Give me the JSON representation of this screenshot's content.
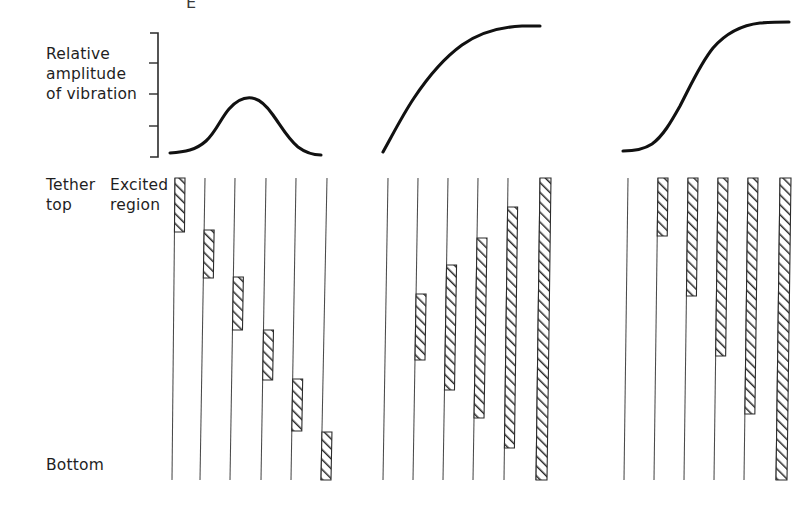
{
  "figure": {
    "clipped_top_text": "E",
    "axis_label_lines": [
      "Relative",
      "amplitude",
      "of vibration"
    ],
    "tether_top_label_lines": [
      "Tether",
      "top"
    ],
    "excited_region_label_lines": [
      "Excited",
      "region"
    ],
    "bottom_label": "Bottom",
    "ink_color": "#111111",
    "line_color": "#4a4a4a",
    "hatch_color": "#2b2b2b",
    "background_color": "#ffffff"
  },
  "chart_data": {
    "type": "line",
    "title": "",
    "subtitle": "",
    "xlabel": "",
    "ylabel": "Relative amplitude of vibration",
    "grid": false,
    "legend_position": "none",
    "axis_notes": "Vertical bracket scale at left of curve row with 3 intermediate tick marks; no numeric tick labels shown.",
    "scale_bracket": {
      "x": 157,
      "y_top": 32,
      "y_bottom": 158,
      "tick_count": 3,
      "tick_y": [
        63,
        94,
        126
      ],
      "tick_length": 9
    },
    "panels": [
      {
        "name": "panel-1-first-mode",
        "curve_shape": "single-hump",
        "x_range": [
          170,
          320
        ],
        "y_range_px": [
          98,
          155
        ],
        "points": [
          {
            "x": 0.0,
            "y": 0.04
          },
          {
            "x": 0.1,
            "y": 0.06
          },
          {
            "x": 0.2,
            "y": 0.16
          },
          {
            "x": 0.3,
            "y": 0.38
          },
          {
            "x": 0.42,
            "y": 0.72
          },
          {
            "x": 0.52,
            "y": 0.94
          },
          {
            "x": 0.58,
            "y": 1.0
          },
          {
            "x": 0.66,
            "y": 0.95
          },
          {
            "x": 0.76,
            "y": 0.72
          },
          {
            "x": 0.86,
            "y": 0.38
          },
          {
            "x": 0.94,
            "y": 0.14
          },
          {
            "x": 1.0,
            "y": 0.06
          }
        ]
      },
      {
        "name": "panel-2-rising-saturating",
        "curve_shape": "concave-rising-plateau",
        "x_range": [
          382,
          540
        ],
        "y_range_px": [
          26,
          152
        ],
        "points": [
          {
            "x": 0.0,
            "y": 0.0
          },
          {
            "x": 0.08,
            "y": 0.18
          },
          {
            "x": 0.18,
            "y": 0.4
          },
          {
            "x": 0.3,
            "y": 0.62
          },
          {
            "x": 0.44,
            "y": 0.8
          },
          {
            "x": 0.58,
            "y": 0.91
          },
          {
            "x": 0.72,
            "y": 0.97
          },
          {
            "x": 0.86,
            "y": 0.99
          },
          {
            "x": 1.0,
            "y": 1.0
          }
        ]
      },
      {
        "name": "panel-3-sigmoid",
        "curve_shape": "sigmoid",
        "x_range": [
          622,
          788
        ],
        "y_range_px": [
          22,
          152
        ],
        "points": [
          {
            "x": 0.0,
            "y": 0.02
          },
          {
            "x": 0.1,
            "y": 0.03
          },
          {
            "x": 0.2,
            "y": 0.08
          },
          {
            "x": 0.32,
            "y": 0.22
          },
          {
            "x": 0.44,
            "y": 0.44
          },
          {
            "x": 0.56,
            "y": 0.68
          },
          {
            "x": 0.68,
            "y": 0.86
          },
          {
            "x": 0.8,
            "y": 0.96
          },
          {
            "x": 0.9,
            "y": 0.99
          },
          {
            "x": 1.0,
            "y": 1.0
          }
        ]
      }
    ]
  },
  "tether_groups": [
    {
      "name": "group-1",
      "description": "Excited region is a short block migrating progressively downward from tether top to bottom.",
      "tether_top_y": 178,
      "tether_bottom_y": 480,
      "tethers": [
        {
          "x_top": 175,
          "x_bottom": 172,
          "bar_top": 178,
          "bar_bottom": 232,
          "bar_width": 10
        },
        {
          "x_top": 205,
          "x_bottom": 200,
          "bar_top": 230,
          "bar_bottom": 278,
          "bar_width": 10
        },
        {
          "x_top": 235,
          "x_bottom": 230,
          "bar_top": 277,
          "bar_bottom": 330,
          "bar_width": 10
        },
        {
          "x_top": 266,
          "x_bottom": 261,
          "bar_top": 330,
          "bar_bottom": 380,
          "bar_width": 10
        },
        {
          "x_top": 296,
          "x_bottom": 291,
          "bar_top": 379,
          "bar_bottom": 431,
          "bar_width": 10
        },
        {
          "x_top": 327,
          "x_bottom": 321,
          "bar_top": 432,
          "bar_bottom": 480,
          "bar_width": 10
        }
      ]
    },
    {
      "name": "group-2",
      "description": "Excited region grows in length and shifts upward until it spans the whole tether.",
      "tether_top_y": 178,
      "tether_bottom_y": 480,
      "tethers": [
        {
          "x_top": 388,
          "x_bottom": 383,
          "bar_top": null,
          "bar_bottom": null,
          "bar_width": 10
        },
        {
          "x_top": 418,
          "x_bottom": 413,
          "bar_top": 294,
          "bar_bottom": 360,
          "bar_width": 10
        },
        {
          "x_top": 448,
          "x_bottom": 443,
          "bar_top": 265,
          "bar_bottom": 390,
          "bar_width": 10
        },
        {
          "x_top": 478,
          "x_bottom": 473,
          "bar_top": 238,
          "bar_bottom": 418,
          "bar_width": 10
        },
        {
          "x_top": 508,
          "x_bottom": 504,
          "bar_top": 207,
          "bar_bottom": 448,
          "bar_width": 10
        },
        {
          "x_top": 540,
          "x_bottom": 536,
          "bar_top": 178,
          "bar_bottom": 480,
          "bar_width": 11
        }
      ]
    },
    {
      "name": "group-3",
      "description": "Excited region anchored at tether top, extending progressively farther down.",
      "tether_top_y": 178,
      "tether_bottom_y": 480,
      "tethers": [
        {
          "x_top": 628,
          "x_bottom": 624,
          "bar_top": null,
          "bar_bottom": null,
          "bar_width": 10
        },
        {
          "x_top": 658,
          "x_bottom": 654,
          "bar_top": 178,
          "bar_bottom": 236,
          "bar_width": 10
        },
        {
          "x_top": 688,
          "x_bottom": 684,
          "bar_top": 178,
          "bar_bottom": 296,
          "bar_width": 10
        },
        {
          "x_top": 718,
          "x_bottom": 714,
          "bar_top": 178,
          "bar_bottom": 356,
          "bar_width": 10
        },
        {
          "x_top": 748,
          "x_bottom": 744,
          "bar_top": 178,
          "bar_bottom": 414,
          "bar_width": 10
        },
        {
          "x_top": 780,
          "x_bottom": 776,
          "bar_top": 178,
          "bar_bottom": 480,
          "bar_width": 11
        }
      ]
    }
  ]
}
